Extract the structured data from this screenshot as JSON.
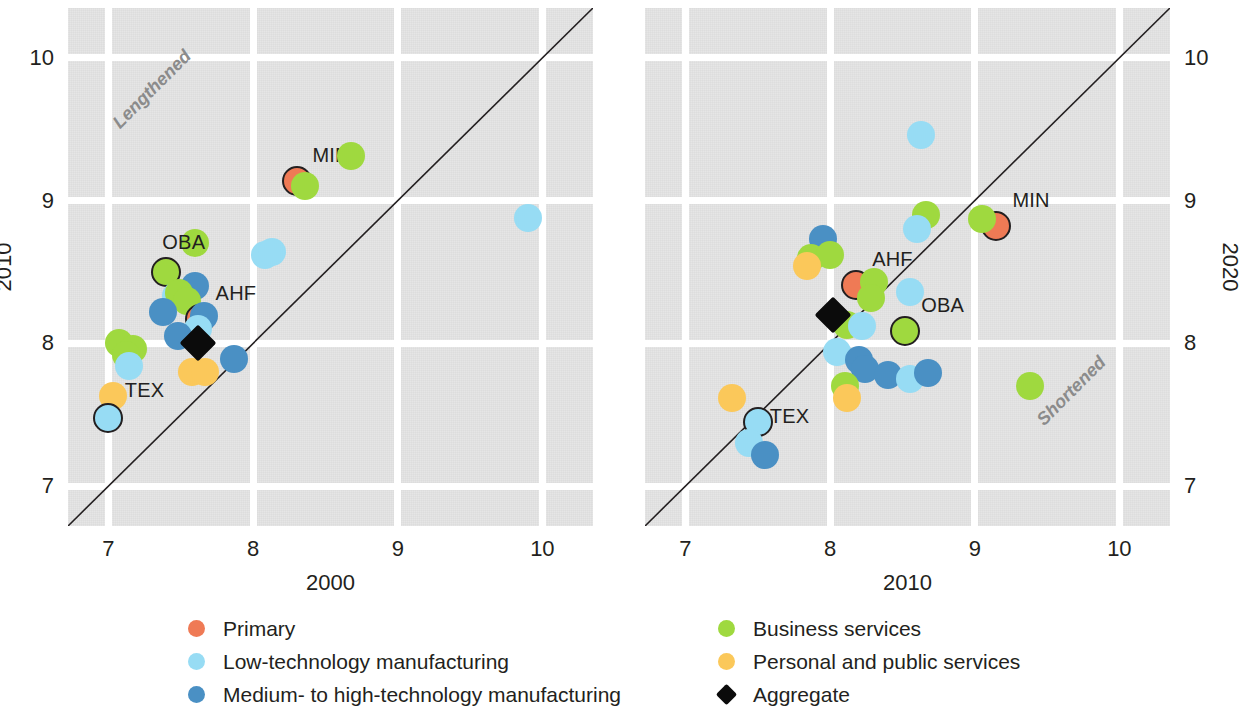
{
  "chart_data": {
    "type": "scatter",
    "title": "",
    "panels": [
      {
        "id": "left",
        "xlabel": "2000",
        "ylabel": "2010",
        "xlim": [
          6.72,
          10.35
        ],
        "ylim": [
          6.72,
          10.35
        ],
        "xticks": [
          "7",
          "8",
          "9",
          "10"
        ],
        "xtickvals": [
          7,
          8,
          9,
          10
        ],
        "yticks": [
          "7",
          "8",
          "9",
          "10"
        ],
        "ytickvals": [
          7,
          8,
          9,
          10
        ],
        "grid": true,
        "identity_line": true,
        "region_note": "Lengthened",
        "region_note_xy": [
          7.05,
          9.6
        ],
        "points": [
          {
            "x": 8.3,
            "y": 9.14,
            "group": "primary",
            "label": "MIN",
            "outlined": true,
            "label_dx": 16,
            "label_dy": -26
          },
          {
            "x": 8.36,
            "y": 9.1,
            "group": "business"
          },
          {
            "x": 8.68,
            "y": 9.31,
            "group": "business"
          },
          {
            "x": 9.9,
            "y": 8.88,
            "group": "lowtech"
          },
          {
            "x": 7.6,
            "y": 8.7,
            "group": "business"
          },
          {
            "x": 7.4,
            "y": 8.5,
            "group": "business",
            "label": "OBA",
            "outlined": true,
            "label_dx": -4,
            "label_dy": -30
          },
          {
            "x": 8.08,
            "y": 8.62,
            "group": "lowtech"
          },
          {
            "x": 8.13,
            "y": 8.64,
            "group": "lowtech"
          },
          {
            "x": 7.6,
            "y": 8.4,
            "group": "mediumhigh"
          },
          {
            "x": 7.47,
            "y": 8.33,
            "group": "lowtech"
          },
          {
            "x": 7.49,
            "y": 8.35,
            "group": "business"
          },
          {
            "x": 7.54,
            "y": 8.3,
            "group": "business"
          },
          {
            "x": 7.38,
            "y": 8.22,
            "group": "mediumhigh"
          },
          {
            "x": 7.63,
            "y": 8.17,
            "group": "primary",
            "label": "AHF",
            "outlined": true,
            "label_dx": 16,
            "label_dy": -26
          },
          {
            "x": 7.66,
            "y": 8.19,
            "group": "mediumhigh"
          },
          {
            "x": 7.62,
            "y": 8.1,
            "group": "lowtech"
          },
          {
            "x": 7.48,
            "y": 8.05,
            "group": "mediumhigh"
          },
          {
            "x": 7.07,
            "y": 8.0,
            "group": "business"
          },
          {
            "x": 7.17,
            "y": 7.96,
            "group": "business"
          },
          {
            "x": 7.12,
            "y": 7.92,
            "group": "business"
          },
          {
            "x": 7.14,
            "y": 7.84,
            "group": "lowtech"
          },
          {
            "x": 7.87,
            "y": 7.89,
            "group": "mediumhigh"
          },
          {
            "x": 7.58,
            "y": 7.8,
            "group": "personal"
          },
          {
            "x": 7.67,
            "y": 7.8,
            "group": "personal"
          },
          {
            "x": 7.03,
            "y": 7.63,
            "group": "personal",
            "label": "TEX",
            "label_dx": 12,
            "label_dy": -6
          },
          {
            "x": 7.0,
            "y": 7.48,
            "group": "lowtech",
            "outlined": true
          },
          {
            "x": 7.62,
            "y": 8.0,
            "group": "aggregate",
            "marker": "diamond"
          }
        ]
      },
      {
        "id": "right",
        "xlabel": "2010",
        "ylabel": "2020",
        "xlim": [
          6.72,
          10.35
        ],
        "ylim": [
          6.72,
          10.35
        ],
        "xticks": [
          "7",
          "8",
          "9",
          "10"
        ],
        "xtickvals": [
          7,
          8,
          9,
          10
        ],
        "yticks": [
          "7",
          "8",
          "9",
          "10"
        ],
        "ytickvals": [
          7,
          8,
          9,
          10
        ],
        "grid": true,
        "identity_line": true,
        "region_note": "Shortened",
        "region_note_xy": [
          9.45,
          7.52
        ],
        "points": [
          {
            "x": 8.63,
            "y": 9.46,
            "group": "lowtech"
          },
          {
            "x": 9.15,
            "y": 8.82,
            "group": "primary",
            "label": "MIN",
            "outlined": true,
            "label_dx": 16,
            "label_dy": -26
          },
          {
            "x": 9.05,
            "y": 8.87,
            "group": "business"
          },
          {
            "x": 8.66,
            "y": 8.9,
            "group": "business"
          },
          {
            "x": 8.6,
            "y": 8.8,
            "group": "lowtech"
          },
          {
            "x": 7.95,
            "y": 8.73,
            "group": "mediumhigh"
          },
          {
            "x": 7.87,
            "y": 8.6,
            "group": "business"
          },
          {
            "x": 8.0,
            "y": 8.62,
            "group": "business"
          },
          {
            "x": 7.84,
            "y": 8.54,
            "group": "personal"
          },
          {
            "x": 8.18,
            "y": 8.41,
            "group": "primary",
            "label": "AHF",
            "outlined": true,
            "label_dx": 16,
            "label_dy": -26
          },
          {
            "x": 8.3,
            "y": 8.43,
            "group": "business"
          },
          {
            "x": 8.28,
            "y": 8.32,
            "group": "business"
          },
          {
            "x": 8.55,
            "y": 8.36,
            "group": "lowtech"
          },
          {
            "x": 8.52,
            "y": 8.09,
            "group": "business",
            "label": "OBA",
            "outlined": true,
            "label_dx": 16,
            "label_dy": -26
          },
          {
            "x": 8.12,
            "y": 8.13,
            "group": "business"
          },
          {
            "x": 8.22,
            "y": 8.12,
            "group": "lowtech"
          },
          {
            "x": 8.05,
            "y": 7.94,
            "group": "lowtech"
          },
          {
            "x": 8.2,
            "y": 7.88,
            "group": "mediumhigh"
          },
          {
            "x": 8.24,
            "y": 7.82,
            "group": "mediumhigh"
          },
          {
            "x": 8.4,
            "y": 7.78,
            "group": "mediumhigh"
          },
          {
            "x": 8.55,
            "y": 7.75,
            "group": "lowtech"
          },
          {
            "x": 8.68,
            "y": 7.79,
            "group": "mediumhigh"
          },
          {
            "x": 9.38,
            "y": 7.7,
            "group": "business"
          },
          {
            "x": 8.1,
            "y": 7.7,
            "group": "business"
          },
          {
            "x": 8.12,
            "y": 7.62,
            "group": "personal"
          },
          {
            "x": 7.32,
            "y": 7.62,
            "group": "personal"
          },
          {
            "x": 7.5,
            "y": 7.45,
            "group": "lowtech",
            "outlined": true,
            "label": "TEX",
            "label_dx": 12,
            "label_dy": -6
          },
          {
            "x": 7.44,
            "y": 7.3,
            "group": "lowtech"
          },
          {
            "x": 7.55,
            "y": 7.22,
            "group": "mediumhigh"
          },
          {
            "x": 8.02,
            "y": 8.2,
            "group": "aggregate",
            "marker": "diamond"
          }
        ]
      }
    ],
    "legend": {
      "position": "bottom",
      "columns": [
        [
          {
            "key": "primary",
            "label": "Primary",
            "color": "#ef7a55",
            "marker": "circle"
          },
          {
            "key": "lowtech",
            "label": "Low-technology manufacturing",
            "color": "#97dcf4",
            "marker": "circle"
          },
          {
            "key": "mediumhigh",
            "label": "Medium- to high-technology manufacturing",
            "color": "#4a90c4",
            "marker": "circle"
          }
        ],
        [
          {
            "key": "business",
            "label": "Business services",
            "color": "#9fd93f",
            "marker": "circle"
          },
          {
            "key": "personal",
            "label": "Personal and public services",
            "color": "#fbc85a",
            "marker": "circle"
          },
          {
            "key": "aggregate",
            "label": "Aggregate",
            "color": "#0b0b0b",
            "marker": "diamond"
          }
        ]
      ]
    },
    "colors": {
      "primary": "#ef7a55",
      "lowtech": "#97dcf4",
      "mediumhigh": "#4a90c4",
      "business": "#9fd93f",
      "personal": "#fbc85a",
      "aggregate": "#0b0b0b",
      "plot_background": "#e3e3e3",
      "gridline": "#ffffff",
      "axis_text": "#231f20",
      "region_note": "#8b8b8b"
    }
  }
}
